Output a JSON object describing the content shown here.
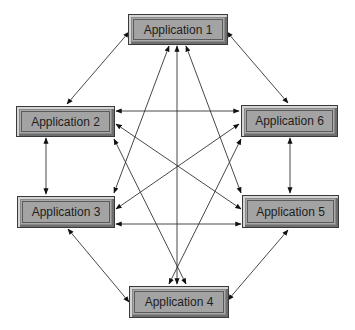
{
  "diagram": {
    "nodes": [
      {
        "id": "app1",
        "label": "Application 1"
      },
      {
        "id": "app2",
        "label": "Application 2"
      },
      {
        "id": "app3",
        "label": "Application 3"
      },
      {
        "id": "app4",
        "label": "Application 4"
      },
      {
        "id": "app5",
        "label": "Application 5"
      },
      {
        "id": "app6",
        "label": "Application 6"
      }
    ],
    "edges": [
      {
        "from": "app1",
        "to": "app2",
        "direction": "both"
      },
      {
        "from": "app1",
        "to": "app6",
        "direction": "both"
      },
      {
        "from": "app1",
        "to": "app3",
        "direction": "both"
      },
      {
        "from": "app1",
        "to": "app4",
        "direction": "both"
      },
      {
        "from": "app1",
        "to": "app5",
        "direction": "both"
      },
      {
        "from": "app2",
        "to": "app3",
        "direction": "both"
      },
      {
        "from": "app2",
        "to": "app6",
        "direction": "both"
      },
      {
        "from": "app2",
        "to": "app5",
        "direction": "both"
      },
      {
        "from": "app2",
        "to": "app4",
        "direction": "both"
      },
      {
        "from": "app3",
        "to": "app6",
        "direction": "both"
      },
      {
        "from": "app3",
        "to": "app5",
        "direction": "both"
      },
      {
        "from": "app3",
        "to": "app4",
        "direction": "both"
      },
      {
        "from": "app6",
        "to": "app5",
        "direction": "both"
      },
      {
        "from": "app6",
        "to": "app4",
        "direction": "both"
      },
      {
        "from": "app5",
        "to": "app4",
        "direction": "both"
      }
    ]
  }
}
